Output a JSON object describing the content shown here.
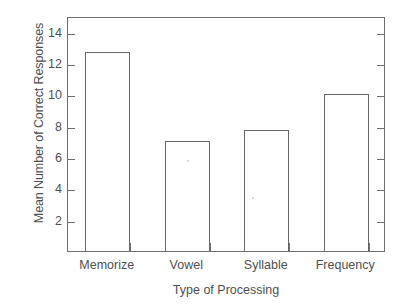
{
  "figure": {
    "background_color": "#ffffff",
    "line_color": "#6e6e6e",
    "bar_edge_color": "#666666",
    "bar_fill_color": "#ffffff",
    "text_color": "#4f4f4f"
  },
  "chart_data": {
    "type": "bar",
    "title": "",
    "xlabel": "Type of Processing",
    "ylabel": "Mean Number of Correct Responses",
    "categories": [
      "Memorize",
      "Vowel",
      "Syllable",
      "Frequency"
    ],
    "values": [
      12.7,
      7.05,
      7.75,
      10.0
    ],
    "ylim": [
      0,
      15
    ],
    "xlim": [
      0,
      4
    ],
    "ytick_labels": [
      "2",
      "4",
      "6",
      "8",
      "10",
      "12",
      "14"
    ],
    "ytick_values": [
      2,
      4,
      6,
      8,
      10,
      12,
      14
    ],
    "grid": false,
    "legend": null,
    "legend_position": "none",
    "bar_style": "outlined-hollow",
    "tick_direction": "in",
    "axes_spines": [
      "left",
      "right",
      "top",
      "bottom"
    ]
  }
}
